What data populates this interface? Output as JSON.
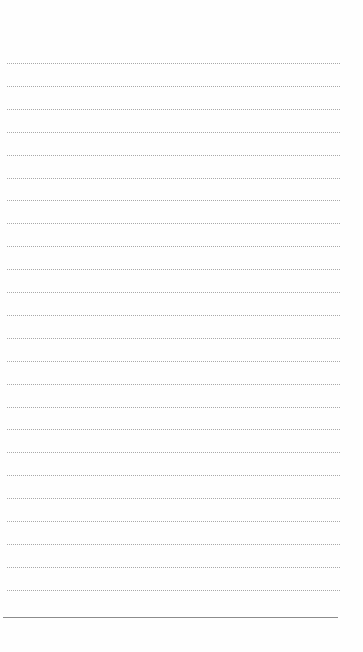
{
  "page": {
    "type": "lined-notepad",
    "background_color": "#fefefe",
    "line_color": "#a9a9a9",
    "bottom_rule_color": "#8c8c8c",
    "ruled_line_count": 24,
    "first_line_y": 63,
    "line_spacing": 22.9,
    "content": []
  }
}
